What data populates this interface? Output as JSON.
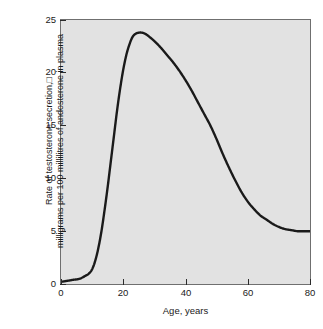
{
  "figure": {
    "background_color": "#ffffff",
    "plot_background_color": "#e2e2e2",
    "frame_color": "#6f6f6f",
    "curve_color": "#1a1a1a"
  },
  "axes": {
    "x": {
      "label": "Age, years",
      "ticks": [
        0,
        20,
        40,
        60,
        80
      ],
      "tick_labels": [
        "0",
        "20",
        "40",
        "60",
        "80"
      ],
      "range": [
        0,
        80
      ]
    },
    "y": {
      "label_line1": "Rate of testosterone secretion,□",
      "label_line2": "milligrams per 100 millilitres of andosterone in plasma",
      "ticks": [
        0,
        5,
        10,
        15,
        20,
        25
      ],
      "tick_labels": [
        "0",
        "5",
        "10",
        "15",
        "20",
        "25"
      ],
      "range": [
        0,
        25
      ]
    }
  },
  "chart_data": {
    "type": "line",
    "title": "",
    "xlabel": "Age, years",
    "ylabel": "Rate of testosterone secretion, milligrams per 100 millilitres of andosterone in plasma",
    "xlim": [
      0,
      80
    ],
    "ylim": [
      0,
      25
    ],
    "xticks": [
      0,
      20,
      40,
      60,
      80
    ],
    "yticks": [
      0,
      5,
      10,
      15,
      20,
      25
    ],
    "grid": false,
    "legend": false,
    "series": [
      {
        "name": "Testosterone secretion rate",
        "x": [
          0,
          2,
          4,
          6,
          8,
          9,
          10,
          11,
          12,
          13,
          14,
          15,
          16,
          17,
          18,
          19,
          20,
          21,
          22,
          23,
          24,
          25,
          26,
          27,
          28,
          30,
          32,
          34,
          36,
          38,
          40,
          42,
          44,
          46,
          48,
          50,
          52,
          54,
          56,
          58,
          60,
          62,
          64,
          66,
          68,
          70,
          72,
          74,
          76,
          78,
          80
        ],
        "y": [
          0.2,
          0.3,
          0.4,
          0.5,
          0.8,
          1.0,
          1.4,
          2.2,
          3.4,
          5.0,
          7.0,
          9.2,
          11.6,
          14.0,
          16.4,
          18.5,
          20.3,
          21.7,
          22.7,
          23.4,
          23.7,
          23.8,
          23.8,
          23.7,
          23.5,
          23.0,
          22.4,
          21.7,
          21.0,
          20.2,
          19.3,
          18.3,
          17.2,
          16.1,
          15.0,
          13.7,
          12.3,
          11.0,
          9.8,
          8.7,
          7.8,
          7.1,
          6.5,
          6.1,
          5.7,
          5.4,
          5.2,
          5.1,
          5.0,
          5.0,
          5.0
        ]
      }
    ],
    "annotations": {
      "peak_value": 23.8,
      "peak_age": 25,
      "plateau_value": 5.0,
      "onset_age": 9
    }
  }
}
